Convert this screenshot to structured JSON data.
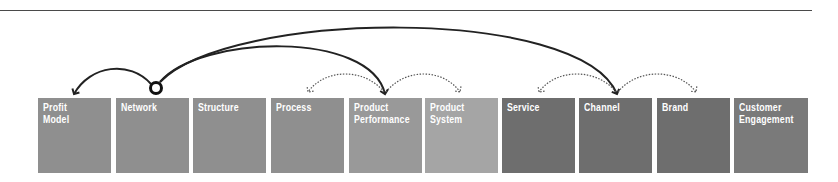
{
  "diagram": {
    "type": "ten-types-of-innovation-linkage",
    "source_node": "Network",
    "boxes": [
      {
        "label_line1": "Profit",
        "label_line2": "Model",
        "color": "#8f8f8f",
        "x": 38
      },
      {
        "label_line1": "Network",
        "label_line2": "",
        "color": "#8f8f8f",
        "x": 116
      },
      {
        "label_line1": "Structure",
        "label_line2": "",
        "color": "#8f8f8f",
        "x": 193
      },
      {
        "label_line1": "Process",
        "label_line2": "",
        "color": "#8f8f8f",
        "x": 271
      },
      {
        "label_line1": "Product",
        "label_line2": "Performance",
        "color": "#999999",
        "x": 349
      },
      {
        "label_line1": "Product",
        "label_line2": "System",
        "color": "#a5a5a5",
        "x": 425
      },
      {
        "label_line1": "Service",
        "label_line2": "",
        "color": "#6e6e6e",
        "x": 502
      },
      {
        "label_line1": "Channel",
        "label_line2": "",
        "color": "#6e6e6e",
        "x": 579
      },
      {
        "label_line1": "Brand",
        "label_line2": "",
        "color": "#6e6e6e",
        "x": 657
      },
      {
        "label_line1": "Customer",
        "label_line2": "Engagement",
        "color": "#7a7a7a",
        "x": 734
      }
    ],
    "solid_arrows": [
      {
        "from": "Network",
        "to": "Profit Model"
      },
      {
        "from": "Network",
        "to": "Product Performance"
      },
      {
        "from": "Network",
        "to": "Channel"
      }
    ],
    "dotted_arrows": [
      {
        "from": "Product Performance",
        "to": "Process"
      },
      {
        "from": "Product Performance",
        "to": "Product System"
      },
      {
        "from": "Channel",
        "to": "Service"
      },
      {
        "from": "Channel",
        "to": "Brand"
      }
    ]
  }
}
